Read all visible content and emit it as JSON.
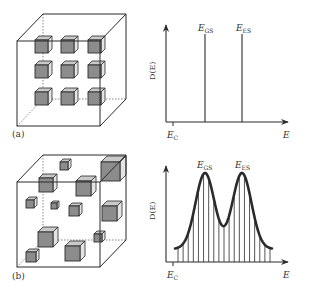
{
  "figure": {
    "panels": [
      {
        "id": "a",
        "label": "(a)",
        "cube": {
          "description": "ordered array of identical quantum dots in a box",
          "dots": [
            {
              "x": 35,
              "y": 40,
              "s": 13
            },
            {
              "x": 61,
              "y": 40,
              "s": 13
            },
            {
              "x": 88,
              "y": 40,
              "s": 13
            },
            {
              "x": 35,
              "y": 65,
              "s": 13
            },
            {
              "x": 61,
              "y": 65,
              "s": 13
            },
            {
              "x": 88,
              "y": 65,
              "s": 13
            },
            {
              "x": 35,
              "y": 92,
              "s": 13
            },
            {
              "x": 61,
              "y": 92,
              "s": 13
            },
            {
              "x": 88,
              "y": 92,
              "s": 13
            }
          ]
        },
        "plot": {
          "ylabel": "D(E)",
          "xlabel": "E",
          "origin_label_main": "E",
          "origin_label_sub": "C",
          "peak1_main": "E",
          "peak1_sub": "GS",
          "peak2_main": "E",
          "peak2_sub": "ES"
        }
      },
      {
        "id": "b",
        "label": "(b)",
        "cube": {
          "description": "disordered ensemble of quantum dots of varying size",
          "dots": [
            {
              "x": 60,
              "y": 162,
              "s": 8
            },
            {
              "x": 39,
              "y": 178,
              "s": 14
            },
            {
              "x": 76,
              "y": 181,
              "s": 15
            },
            {
              "x": 101,
              "y": 162,
              "s": 19
            },
            {
              "x": 26,
              "y": 200,
              "s": 8
            },
            {
              "x": 51,
              "y": 203,
              "s": 6
            },
            {
              "x": 69,
              "y": 206,
              "s": 10
            },
            {
              "x": 102,
              "y": 206,
              "s": 15
            },
            {
              "x": 38,
              "y": 232,
              "s": 15
            },
            {
              "x": 94,
              "y": 234,
              "s": 8
            },
            {
              "x": 26,
              "y": 252,
              "s": 10
            },
            {
              "x": 65,
              "y": 246,
              "s": 15
            }
          ]
        },
        "plot": {
          "ylabel": "D(E)",
          "xlabel": "E",
          "origin_label_main": "E",
          "origin_label_sub": "C",
          "peak1_main": "E",
          "peak1_sub": "GS",
          "peak2_main": "E",
          "peak2_sub": "ES"
        }
      }
    ]
  },
  "chart_data": [
    {
      "type": "line",
      "title": "(a) Density of states for identical quantum dots",
      "xlabel": "E",
      "ylabel": "D(E)",
      "x_ticks": [
        "E_C"
      ],
      "annotations": [
        "E_GS",
        "E_ES"
      ],
      "series": [
        {
          "name": "delta-function DOS",
          "x": [
            "E_GS",
            "E_ES"
          ],
          "values": [
            1,
            1
          ],
          "style": "vertical spikes"
        }
      ],
      "grid": false
    },
    {
      "type": "line",
      "title": "(b) Inhomogeneously broadened density of states",
      "xlabel": "E",
      "ylabel": "D(E)",
      "x_ticks": [
        "E_C"
      ],
      "annotations": [
        "E_GS",
        "E_ES"
      ],
      "series": [
        {
          "name": "broadened DOS envelope",
          "x": [
            "start",
            "E_GS",
            "trough",
            "E_ES",
            "end"
          ],
          "values": [
            0.15,
            1.0,
            0.33,
            1.0,
            0.15
          ],
          "style": "two gaussian peaks filled with vertical lines"
        }
      ],
      "grid": false
    }
  ],
  "colors": {
    "line": "#2a2a2a",
    "dot_front": "#8c8c8c",
    "dot_top": "#c9c9c9",
    "dot_side": "#e4e4e4",
    "text": "#333333"
  }
}
